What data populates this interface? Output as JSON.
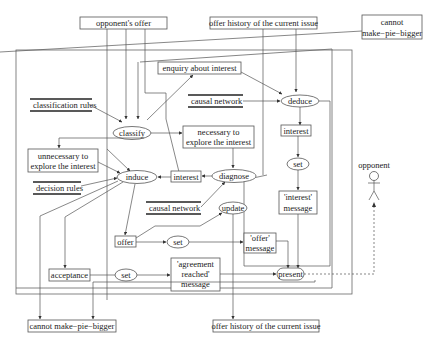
{
  "diagram": {
    "external_inputs": {
      "opponents_offer": "opponent's offer",
      "offer_history_top": "offer history of the current issue",
      "cannot_pie_line1": "cannot",
      "cannot_pie_line2": "make−pie−bigger"
    },
    "data_stores": {
      "classification_rules": "classification rules",
      "causal_network_top": "causal network",
      "decision_rules": "decision rules",
      "causal_network_mid": "causal network"
    },
    "processes": {
      "classify": "classify",
      "deduce": "deduce",
      "diagnose": "diagnose",
      "induce": "induce",
      "update": "update",
      "set_interest": "set",
      "set_offer": "set",
      "set_acceptance": "set",
      "present": "present"
    },
    "boxes": {
      "enquiry": "enquiry about interest",
      "necessary_line1": "necessary to",
      "necessary_line2": "explore the interest",
      "unnecessary_line1": "unnecessary to",
      "unnecessary_line2": "explore the interest",
      "interest_left": "interest",
      "interest_right": "interest",
      "interest_msg_line1": "'interest'",
      "interest_msg_line2": "message",
      "offer": "offer",
      "offer_msg_line1": "'offer'",
      "offer_msg_line2": "message",
      "acceptance": "acceptance",
      "agreement_line1": "'agreement",
      "agreement_line2": "reached'",
      "agreement_line3": "message"
    },
    "outputs": {
      "cannot_pie_bottom": "cannot make−pie−bigger",
      "offer_history_bottom": "offer history of the current issue"
    },
    "actor": {
      "label": "opponent"
    }
  }
}
